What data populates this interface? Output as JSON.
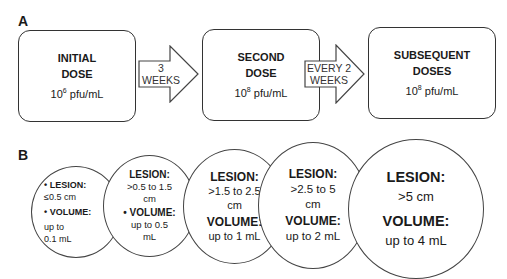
{
  "panel_a": {
    "label": "A",
    "boxes": [
      {
        "title_line1": "INITIAL",
        "title_line2": "DOSE",
        "conc_base": "10",
        "conc_exp": "6",
        "conc_unit": " pfu/mL"
      },
      {
        "title_line1": "SECOND",
        "title_line2": "DOSE",
        "conc_base": "10",
        "conc_exp": "8",
        "conc_unit": " pfu/mL"
      },
      {
        "title_line1": "SUBSEQUENT",
        "title_line2": "DOSES",
        "conc_base": "10",
        "conc_exp": "8",
        "conc_unit": " pfu/mL"
      }
    ],
    "arrows": [
      {
        "line1": "3",
        "line2": "WEEKS"
      },
      {
        "line1": "EVERY 2",
        "line2": "WEEKS"
      }
    ]
  },
  "panel_b": {
    "label": "B",
    "circles": [
      {
        "lesion_label": "• LESION:",
        "lesion_value": "≤0.5 cm",
        "volume_label": "• VOLUME:",
        "volume_value_1": "up to",
        "volume_value_2": "0.1 mL"
      },
      {
        "lesion_label": "LESION:",
        "lesion_value_1": ">0.5 to 1.5",
        "lesion_value_2": "cm",
        "volume_label": "• VOLUME:",
        "volume_value_1": "up to 0.5",
        "volume_value_2": "mL"
      },
      {
        "lesion_label": "LESION:",
        "lesion_value_1": ">1.5 to 2.5",
        "lesion_value_2": "cm",
        "volume_label": "VOLUME:",
        "volume_value": "up to 1 mL"
      },
      {
        "lesion_label": "LESION:",
        "lesion_value_1": ">2.5 to 5",
        "lesion_value_2": "cm",
        "volume_label": "VOLUME:",
        "volume_value": "up to 2 mL"
      },
      {
        "lesion_label": "LESION:",
        "lesion_value": ">5 cm",
        "volume_label": "VOLUME:",
        "volume_value": "up to 4 mL"
      }
    ]
  }
}
